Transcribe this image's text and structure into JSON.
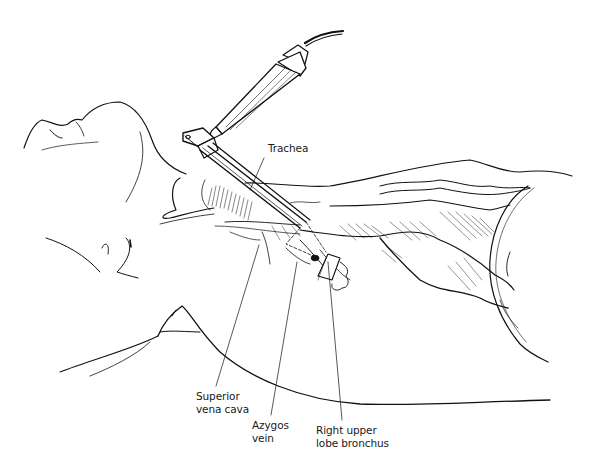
{
  "figure": {
    "colors": {
      "line": "#111111",
      "background": "#ffffff",
      "label_text": "#1a1a1a"
    }
  },
  "labels": [
    {
      "id": "trachea",
      "lines": [
        "Trachea"
      ]
    },
    {
      "id": "superior-vena-cava",
      "lines": [
        "Superior",
        "vena cava"
      ]
    },
    {
      "id": "azygos-vein",
      "lines": [
        "Azygos",
        "vein"
      ]
    },
    {
      "id": "right-upper-lobe-bronchus",
      "lines": [
        "Right upper",
        "lobe bronchus"
      ]
    }
  ]
}
